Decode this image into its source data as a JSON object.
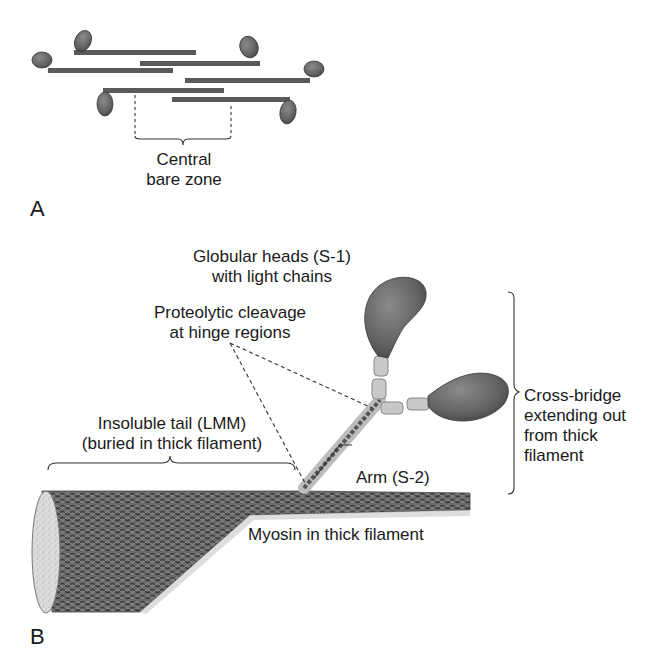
{
  "figure": {
    "panels": [
      {
        "id": "A",
        "label": "A",
        "annotations": {
          "central_bare_zone": [
            "Central",
            "bare zone"
          ]
        }
      },
      {
        "id": "B",
        "label": "B",
        "annotations": {
          "globular_heads": [
            "Globular heads (S-1)",
            "with light chains"
          ],
          "proteolytic_cleavage": [
            "Proteolytic cleavage",
            "at hinge regions"
          ],
          "insoluble_tail": [
            "Insoluble tail (LMM)",
            "(buried in thick filament)"
          ],
          "arm": "Arm (S-2)",
          "cross_bridge": [
            "Cross-bridge",
            "extending out",
            "from thick",
            "filament"
          ],
          "myosin_thick_filament": "Myosin in thick filament"
        }
      }
    ],
    "colors": {
      "head_fill": "#6e6e6e",
      "head_dark": "#4a4a4a",
      "rod": "#5a5a5a",
      "light_chain": "#c8c8c8",
      "filament": "#555555",
      "cross_section": "#d8d8d8",
      "text": "#1a1a1a"
    }
  }
}
